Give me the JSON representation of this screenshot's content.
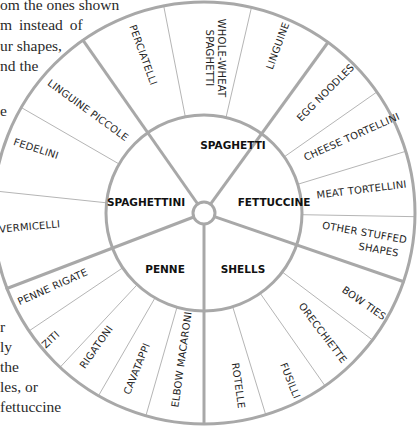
{
  "background_text": {
    "lines_right_side_of_left_column": [
      {
        "text": "om the ones shown",
        "x": 152,
        "y": 3
      },
      {
        "text": "m  instead  of",
        "x": 160,
        "y": 24
      },
      {
        "text": "ur shapes,",
        "x": 175,
        "y": 44
      },
      {
        "text": "nd the",
        "x": 185,
        "y": 64
      }
    ],
    "lines_top_left": [
      {
        "text": "om the ones shown",
        "x": 0,
        "y": 0
      },
      {
        "text": "m  instead  of",
        "x": 0,
        "y": 20
      },
      {
        "text": "ur shapes,",
        "x": 0,
        "y": 41
      },
      {
        "text": "nd the",
        "x": 0,
        "y": 61
      },
      {
        "text": "e",
        "x": 0,
        "y": 104
      }
    ],
    "lines_bottom_left": [
      {
        "text": "r",
        "x": 0,
        "y": 325
      },
      {
        "text": "ly",
        "x": 0,
        "y": 343
      },
      {
        "text": "the",
        "x": 0,
        "y": 364
      },
      {
        "text": "les, or",
        "x": 0,
        "y": 384
      },
      {
        "text": "fettuccine",
        "x": 0,
        "y": 405
      }
    ]
  },
  "wheel": {
    "colors": {
      "line": "#aaaaaa",
      "text": "#1e1e1e",
      "group_text": "#111111"
    },
    "groups": [
      {
        "name": "SPAGHETTI",
        "start_deg": 325,
        "end_deg": 36,
        "items": [
          {
            "label": "PERCIATELLI",
            "start_deg": 325,
            "end_deg": 349
          },
          {
            "label": "WHOLE-WHEAT SPAGHETTI",
            "start_deg": 349,
            "end_deg": 13
          },
          {
            "label": "LINGUINE",
            "start_deg": 13,
            "end_deg": 36
          }
        ]
      },
      {
        "name": "FETTUCCINE",
        "start_deg": 36,
        "end_deg": 109,
        "items": [
          {
            "label": "EGG NOODLES",
            "start_deg": 36,
            "end_deg": 55
          },
          {
            "label": "CHEESE TORTELLINI",
            "start_deg": 55,
            "end_deg": 73
          },
          {
            "label": "MEAT TORTELLINI",
            "start_deg": 73,
            "end_deg": 91
          },
          {
            "label": "OTHER STUFFED SHAPES",
            "start_deg": 91,
            "end_deg": 109
          }
        ]
      },
      {
        "name": "SHELLS",
        "start_deg": 109,
        "end_deg": 180,
        "items": [
          {
            "label": "BOW TIES",
            "start_deg": 109,
            "end_deg": 127
          },
          {
            "label": "ORECCHIETTE",
            "start_deg": 127,
            "end_deg": 145
          },
          {
            "label": "FUSILLI",
            "start_deg": 145,
            "end_deg": 163
          },
          {
            "label": "ROTELLE",
            "start_deg": 163,
            "end_deg": 180
          }
        ]
      },
      {
        "name": "PENNE",
        "start_deg": 180,
        "end_deg": 249,
        "items": [
          {
            "label": "ELBOW MACARONI",
            "start_deg": 180,
            "end_deg": 196
          },
          {
            "label": "CAVATAPPI",
            "start_deg": 196,
            "end_deg": 210
          },
          {
            "label": "RIGATONI",
            "start_deg": 210,
            "end_deg": 223
          },
          {
            "label": "ZITI",
            "start_deg": 223,
            "end_deg": 236
          },
          {
            "label": "PENNE RIGATE",
            "start_deg": 236,
            "end_deg": 249
          }
        ]
      },
      {
        "name": "SPAGHETTINI",
        "start_deg": 249,
        "end_deg": 325,
        "items": [
          {
            "label": "VERMICELLI",
            "start_deg": 249,
            "end_deg": 276
          },
          {
            "label": "FEDELINI",
            "start_deg": 276,
            "end_deg": 300
          },
          {
            "label": "LINGUINE PICCOLE",
            "start_deg": 300,
            "end_deg": 325
          }
        ]
      }
    ]
  },
  "labels": {
    "group_spaghetti": "SPAGHETTI",
    "group_fettuccine": "FETTUCCINE",
    "group_shells": "SHELLS",
    "group_penne": "PENNE",
    "group_spaghettini": "SPAGHETTINI",
    "perciatelli": "PERCIATELLI",
    "whole_wheat_1": "WHOLE-WHEAT",
    "whole_wheat_2": "SPAGHETTI",
    "linguine": "LINGUINE",
    "egg_noodles": "EGG NOODLES",
    "cheese_tortellini": "CHEESE TORTELLINI",
    "meat_tortellini": "MEAT TORTELLINI",
    "other_stuffed_1": "OTHER STUFFED",
    "other_stuffed_2": "SHAPES",
    "bow_ties": "BOW TIES",
    "orecchiette": "ORECCHIETTE",
    "fusilli": "FUSILLI",
    "rotelle": "ROTELLE",
    "elbow_macaroni": "ELBOW MACARONI",
    "cavatappi": "CAVATAPPI",
    "rigatoni": "RIGATONI",
    "ziti": "ZITI",
    "penne_rigate": "PENNE RIGATE",
    "vermicelli": "VERMICELLI",
    "fedelini": "FEDELINI",
    "linguine_piccole": "LINGUINE PICCOLE"
  },
  "page_text": {
    "l1": "om the ones shown",
    "l2": "m  instead  of",
    "l3": "ur shapes,",
    "l4": "nd the",
    "l5": "e",
    "l6": "r",
    "l7": "ly",
    "l8": "the",
    "l9": "les, or",
    "l10": "fettuccine"
  }
}
